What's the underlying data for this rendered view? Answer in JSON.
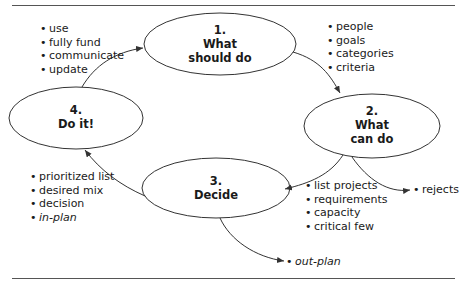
{
  "diagram": {
    "colors": {
      "line": "#333333",
      "rule": "#555555",
      "text": "#1a1a1a",
      "background": "#ffffff"
    },
    "nodes": [
      {
        "number": "1.",
        "line1": "What",
        "line2": "should do"
      },
      {
        "number": "2.",
        "line1": "What",
        "line2": "can do"
      },
      {
        "number": "3.",
        "line1": "Decide",
        "line2": ""
      },
      {
        "number": "4.",
        "line1": "Do it!",
        "line2": ""
      }
    ],
    "bullet_lists": {
      "do_it": [
        "use",
        "fully fund",
        "communicate",
        "update"
      ],
      "should_do": [
        "people",
        "goals",
        "categories",
        "criteria"
      ],
      "can_do": [
        "list projects",
        "requirements",
        "capacity",
        "critical few"
      ],
      "rejects": [
        "rejects"
      ],
      "decide": [
        "prioritized list",
        "desired mix",
        "decision",
        "in-plan"
      ],
      "out_plan": [
        "out-plan"
      ]
    }
  }
}
